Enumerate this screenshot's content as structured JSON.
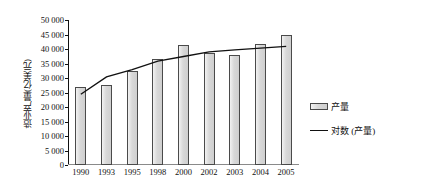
{
  "chart_data": {
    "type": "bar",
    "title": "",
    "xlabel": "",
    "ylabel": "造业产量(亿美元)",
    "categories": [
      "1990",
      "1993",
      "1995",
      "1998",
      "2000",
      "2002",
      "2003",
      "2004",
      "2005"
    ],
    "ylim": [
      0,
      50000
    ],
    "ytick_labels": [
      "50 000",
      "45 000",
      "40 000",
      "35 000",
      "30 000",
      "25 000",
      "20 000",
      "15 000",
      "10 000",
      "5 000",
      "0"
    ],
    "ytick_values": [
      50000,
      45000,
      40000,
      35000,
      30000,
      25000,
      20000,
      15000,
      10000,
      5000,
      0
    ],
    "grid": false,
    "legend_position": "right",
    "series": [
      {
        "name": "产量",
        "kind": "bar",
        "values": [
          27000,
          27500,
          32500,
          36700,
          41500,
          38500,
          38000,
          41700,
          44800
        ]
      },
      {
        "name": "对数 (产量)",
        "kind": "line",
        "values": [
          24400,
          30400,
          32900,
          35800,
          37400,
          39000,
          39700,
          40300,
          40900
        ]
      }
    ],
    "legend": [
      {
        "label": "产量",
        "marker": "bar-swatch"
      },
      {
        "label": "对数 (产量)",
        "marker": "line-swatch"
      }
    ]
  }
}
